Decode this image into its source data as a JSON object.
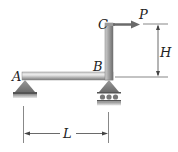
{
  "figure": {
    "type": "structural-frame",
    "points": {
      "A": "A",
      "B": "B",
      "C": "C"
    },
    "load": {
      "label": "P",
      "direction": "right"
    },
    "dimensions": {
      "horizontal": "L",
      "vertical": "H"
    },
    "supports": {
      "A": "pin",
      "B": "roller"
    },
    "colors": {
      "member": "#8a8a8a",
      "member_highlight": "#e6e6e6",
      "support": "#8c8c8c",
      "ground": "#b5b5b5",
      "dimension": "#444444",
      "label": "#222222"
    }
  }
}
